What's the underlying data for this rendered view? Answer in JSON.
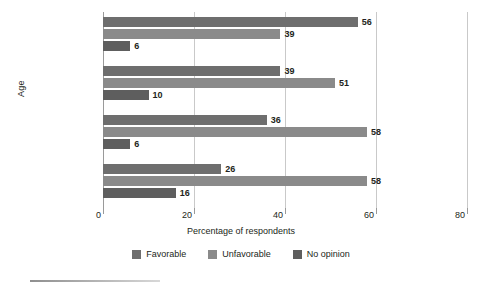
{
  "chart_data": {
    "type": "bar",
    "orientation": "horizontal",
    "title": "",
    "xlabel": "Percentage of respondents",
    "ylabel": "Age",
    "categories": [
      "18–29",
      "30–49",
      "50–64",
      "65 and older"
    ],
    "series": [
      {
        "name": "Favorable",
        "color": "#6e6e6e",
        "values": [
          56,
          39,
          36,
          26
        ]
      },
      {
        "name": "Unfavorable",
        "color": "#8a8a8a",
        "values": [
          39,
          51,
          58,
          58
        ]
      },
      {
        "name": "No opinion",
        "color": "#5e5e5e",
        "values": [
          6,
          10,
          6,
          16
        ]
      }
    ],
    "xlim": [
      0,
      80
    ],
    "xticks": [
      0,
      20,
      40,
      60,
      80
    ],
    "xtick_labels": [
      "0",
      "20",
      "40",
      "60",
      "80"
    ],
    "grid": true,
    "grid_axis": "x",
    "legend_position": "bottom",
    "data_labels": true
  },
  "legend": {
    "items": [
      {
        "label": "Favorable"
      },
      {
        "label": "Unfavorable"
      },
      {
        "label": "No opinion"
      }
    ]
  }
}
